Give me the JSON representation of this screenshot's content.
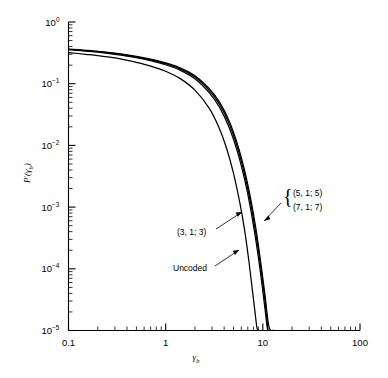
{
  "chart_data": {
    "type": "line",
    "title": "",
    "subtitle": "",
    "xlabel": "γb",
    "ylabel": "P'(γb)",
    "xscale": "log",
    "yscale": "log",
    "xlim": [
      0.1,
      100
    ],
    "ylim": [
      1e-05,
      1
    ],
    "grid": false,
    "legend_position": "inline-annotations",
    "xticks": [
      "0.1",
      "1",
      "10",
      "100"
    ],
    "xtick_values": [
      0.1,
      1,
      10,
      100
    ],
    "yticks": [
      "10⁰",
      "10⁻¹",
      "10⁻²",
      "10⁻³",
      "10⁻⁴",
      "10⁻⁵"
    ],
    "ytick_values": [
      1,
      0.1,
      0.01,
      0.001,
      0.0001,
      1e-05
    ],
    "ytick_mantissas": [
      "10",
      "10",
      "10",
      "10",
      "10",
      "10"
    ],
    "ytick_exponents": [
      "0",
      "-1",
      "-2",
      "-3",
      "-4",
      "-5"
    ],
    "series": [
      {
        "name": "Uncoded",
        "x": [
          0.1,
          0.15,
          0.2,
          0.3,
          0.4,
          0.5,
          0.7,
          1.0,
          1.4,
          2.0,
          2.8,
          3.5,
          4.2,
          5.0,
          5.8,
          6.5,
          7.2,
          7.8,
          8.3,
          8.7,
          9.0
        ],
        "values": [
          0.32,
          0.3,
          0.286,
          0.262,
          0.24,
          0.222,
          0.193,
          0.159,
          0.122,
          0.0786,
          0.0401,
          0.0202,
          0.00932,
          0.0035,
          0.00117,
          0.00042,
          0.00013,
          4.6e-05,
          2e-05,
          1.1e-05,
          1e-05
        ]
      },
      {
        "name": "(3, 1; 3)",
        "x": [
          0.1,
          0.15,
          0.2,
          0.3,
          0.4,
          0.5,
          0.7,
          1.0,
          1.4,
          2.0,
          2.8,
          3.6,
          4.5,
          5.5,
          6.5,
          7.5,
          8.5,
          9.5,
          10.5,
          11.3,
          12.0
        ],
        "values": [
          0.355,
          0.338,
          0.324,
          0.3,
          0.281,
          0.264,
          0.236,
          0.203,
          0.166,
          0.12,
          0.0715,
          0.041,
          0.0195,
          0.0077,
          0.00278,
          0.00092,
          0.00028,
          8.2e-05,
          2.3e-05,
          9.5e-06,
          1e-05
        ]
      },
      {
        "name": "(5, 1; 5)",
        "x": [
          0.1,
          0.15,
          0.2,
          0.3,
          0.4,
          0.5,
          0.7,
          1.0,
          1.4,
          2.0,
          2.8,
          3.6,
          4.5,
          5.5,
          6.5,
          7.5,
          8.5,
          9.5,
          10.5,
          11.5,
          12.4,
          13.0
        ],
        "values": [
          0.36,
          0.343,
          0.33,
          0.306,
          0.288,
          0.271,
          0.244,
          0.211,
          0.174,
          0.128,
          0.078,
          0.0457,
          0.0224,
          0.00909,
          0.00337,
          0.00115,
          0.00036,
          0.00011,
          3.1e-05,
          9e-06,
          1e-05,
          1e-05
        ]
      },
      {
        "name": "(7, 1; 7)",
        "x": [
          0.1,
          0.15,
          0.2,
          0.3,
          0.4,
          0.5,
          0.7,
          1.0,
          1.4,
          2.0,
          2.8,
          3.6,
          4.5,
          5.5,
          6.5,
          7.5,
          8.5,
          9.5,
          10.5,
          11.5,
          12.5,
          13.4
        ],
        "values": [
          0.364,
          0.348,
          0.335,
          0.312,
          0.294,
          0.278,
          0.251,
          0.218,
          0.181,
          0.135,
          0.0837,
          0.0498,
          0.0249,
          0.0103,
          0.00391,
          0.00136,
          0.00044,
          0.00013,
          3.9e-05,
          1.2e-05,
          9.8e-06,
          1e-05
        ]
      }
    ],
    "annotations": [
      {
        "id": "grp57",
        "text_lines": [
          "(5, 1; 5)",
          "(7, 1; 7)"
        ],
        "brace": "{"
      },
      {
        "id": "c313",
        "text": "(3, 1; 3)"
      },
      {
        "id": "unc",
        "text": "Uncoded"
      }
    ],
    "colors": {
      "curve": "#000000",
      "axis": "#000000",
      "background": "#ffffff"
    }
  },
  "axis": {
    "y_title_main": "P",
    "y_title_prime": "′",
    "y_title_paren_open": "(",
    "y_title_gamma": "γ",
    "y_title_sub": "b",
    "y_title_paren_close": ")",
    "x_title_gamma": "γ",
    "x_title_sub": "b"
  },
  "labels": {
    "x0": "0.1",
    "x1": "1",
    "x2": "10",
    "x3": "100",
    "y0_m": "10",
    "y0_e": "0",
    "y1_m": "10",
    "y1_e": "−1",
    "y2_m": "10",
    "y2_e": "−2",
    "y3_m": "10",
    "y3_e": "−3",
    "y4_m": "10",
    "y4_e": "−4",
    "y5_m": "10",
    "y5_e": "−5",
    "anno_57_a": "(5, 1; 5)",
    "anno_57_b": "(7, 1; 7)",
    "anno_313": "(3, 1; 3)",
    "anno_uncoded": "Uncoded",
    "brace": "{"
  }
}
